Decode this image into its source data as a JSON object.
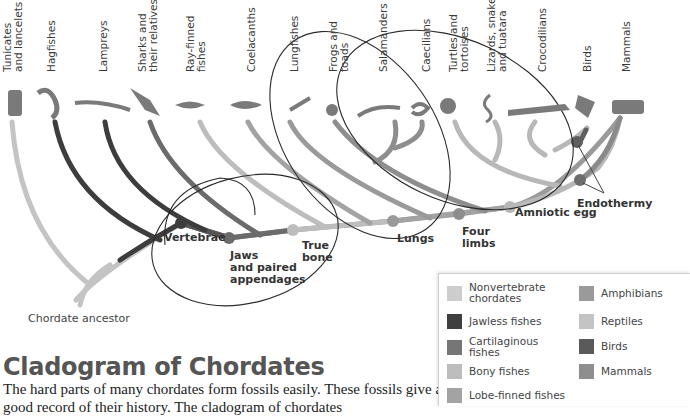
{
  "taxa": [
    {
      "label": "Tunicates\nand lancelets",
      "x": 2,
      "color": "#c4c4c4",
      "icon": "tunicate-icon"
    },
    {
      "label": "Hagfishes",
      "x": 45,
      "color": "#3d3d3d",
      "icon": "hagfish-icon"
    },
    {
      "label": "Lampreys",
      "x": 97,
      "color": "#3d3d3d",
      "icon": "lamprey-icon"
    },
    {
      "label": "Sharks and\ntheir relatives",
      "x": 137,
      "color": "#6b6b6b",
      "icon": "shark-icon"
    },
    {
      "label": "Ray-finned\nfishes",
      "x": 185,
      "color": "#a9a9a9",
      "icon": "ray-finned-fish-icon"
    },
    {
      "label": "Coelacanths",
      "x": 245,
      "color": "#9a9a9a",
      "icon": "coelacanth-icon"
    },
    {
      "label": "Lungfishes",
      "x": 288,
      "color": "#9a9a9a",
      "icon": "lungfish-icon"
    },
    {
      "label": "Frogs and\ntoads",
      "x": 328,
      "color": "#8e8e8e",
      "icon": "frog-icon"
    },
    {
      "label": "Salamanders",
      "x": 377,
      "color": "#8e8e8e",
      "icon": "salamander-icon"
    },
    {
      "label": "Caecilians",
      "x": 420,
      "color": "#8e8e8e",
      "icon": "caecilian-icon"
    },
    {
      "label": "Turtles and\ntortoises",
      "x": 448,
      "color": "#b8b8b8",
      "icon": "turtle-icon"
    },
    {
      "label": "Lizards, snakes,\nand tuatara",
      "x": 486,
      "color": "#b8b8b8",
      "icon": "snake-icon"
    },
    {
      "label": "Crocodilians",
      "x": 536,
      "color": "#b8b8b8",
      "icon": "crocodile-icon"
    },
    {
      "label": "Birds",
      "x": 581,
      "color": "#5e5e5e",
      "icon": "bird-icon"
    },
    {
      "label": "Mammals",
      "x": 620,
      "color": "#8a8a8a",
      "icon": "cow-icon"
    }
  ],
  "traits": [
    {
      "label": "Vertebrae",
      "x": 164,
      "y": 232,
      "dot_x": 181,
      "dot_y": 223,
      "dot_color": "#3d3d3d"
    },
    {
      "label": "Jaws\nand paired\nappendages",
      "x": 230,
      "y": 250,
      "dot_x": 229,
      "dot_y": 238,
      "dot_color": "#6b6b6b"
    },
    {
      "label": "True\nbone",
      "x": 302,
      "y": 240,
      "dot_x": 293,
      "dot_y": 230,
      "dot_color": "#bdbdbd"
    },
    {
      "label": "Lungs",
      "x": 397,
      "y": 233,
      "dot_x": 393,
      "dot_y": 221,
      "dot_color": "#9a9a9a"
    },
    {
      "label": "Four\nlimbs",
      "x": 462,
      "y": 226,
      "dot_x": 459,
      "dot_y": 214,
      "dot_color": "#8e8e8e"
    },
    {
      "label": "Amniotic egg",
      "x": 515,
      "y": 207,
      "dot_x": 510,
      "dot_y": 207,
      "dot_color": "#b8b8b8"
    },
    {
      "label": "Endothermy",
      "x": 577,
      "y": 198,
      "dot_x": 580,
      "dot_y": 180,
      "dot_color": "#6e6e6e"
    }
  ],
  "root_label": "Chordate ancestor",
  "title": "Cladogram of Chordates",
  "body_text": "The hard parts of many chordates form fossils easily. These fossils give a good record of their history. The cladogram of chordates",
  "legend": {
    "items": [
      {
        "label": "Nonvertebrate\nchordates",
        "color": "#cdcdcd"
      },
      {
        "label": "Jawless fishes",
        "color": "#3f3f3f"
      },
      {
        "label": "Cartilaginous\nfishes",
        "color": "#767676"
      },
      {
        "label": "Bony fishes",
        "color": "#bdbdbd"
      },
      {
        "label": "Lobe-finned fishes",
        "color": "#a3a3a3"
      },
      {
        "label": "Amphibians",
        "color": "#9a9a9a"
      },
      {
        "label": "Reptiles",
        "color": "#c4c4c4"
      },
      {
        "label": "Birds",
        "color": "#5a5a5a"
      },
      {
        "label": "Mammals",
        "color": "#8e8e8e"
      }
    ]
  }
}
